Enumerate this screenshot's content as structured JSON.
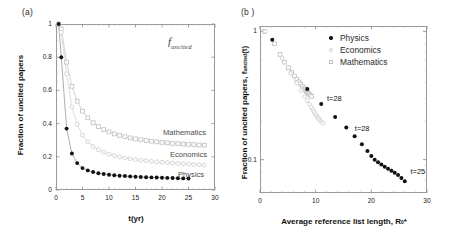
{
  "figure": {
    "panel_a_label": "(a)",
    "panel_b_label": "(b )"
  },
  "panel_a": {
    "annotation_f": "f",
    "annotation_sub": "uncited",
    "xlabel": "t(yr)",
    "ylabel": "Fraction of uncited papers",
    "xticks": [
      "0",
      "5",
      "10",
      "15",
      "20",
      "25",
      "30"
    ],
    "yticks": [
      "0",
      "0.2",
      "0.4",
      "0.6",
      "0.8",
      "1"
    ],
    "curve_labels": [
      "Mathematics",
      "Economics",
      "Physics"
    ]
  },
  "panel_b": {
    "xlabel_main": "Average reference list length, R",
    "xlabel_sub": "0",
    "xlabel_star": "*",
    "ylabel_main": "Fraction of uncited papers, f",
    "ylabel_sub": "uncited",
    "ylabel_tail": "(t)",
    "xticks": [
      "0",
      "10",
      "20",
      "30"
    ],
    "yticks": [
      "1",
      "0.1"
    ],
    "legend": [
      {
        "label": "Physics",
        "marker": "filled-circle",
        "color": "#111111"
      },
      {
        "label": "Economics",
        "marker": "open-circle",
        "color": "#cfcfcf"
      },
      {
        "label": "Mathematics",
        "marker": "open-square",
        "color": "#c2c2c2"
      }
    ],
    "annotations": [
      "t=28",
      "t=28",
      "t=25"
    ]
  },
  "chart_data": [
    {
      "type": "line",
      "panel": "a",
      "title": "",
      "xlabel": "t(yr)",
      "ylabel": "Fraction of uncited papers",
      "xlim": [
        0,
        30
      ],
      "ylim": [
        0,
        1
      ],
      "xticks": [
        0,
        5,
        10,
        15,
        20,
        25,
        30
      ],
      "yticks": [
        0,
        0.2,
        0.4,
        0.6,
        0.8,
        1
      ],
      "grid": false,
      "legend": "inline-right-labels",
      "series": [
        {
          "name": "Physics",
          "marker": "filled-circle",
          "color": "#111111",
          "x": [
            0.5,
            1,
            2,
            3,
            4,
            5,
            6,
            7,
            8,
            9,
            10,
            11,
            12,
            13,
            14,
            15,
            16,
            17,
            18,
            19,
            20,
            21,
            22,
            23,
            24,
            25
          ],
          "y": [
            1.0,
            0.8,
            0.37,
            0.22,
            0.162,
            0.132,
            0.118,
            0.108,
            0.101,
            0.096,
            0.092,
            0.089,
            0.086,
            0.084,
            0.082,
            0.08,
            0.078,
            0.077,
            0.076,
            0.075,
            0.074,
            0.073,
            0.072,
            0.071,
            0.07,
            0.069
          ]
        },
        {
          "name": "Economics",
          "marker": "open-circle",
          "color": "#cfcfcf",
          "x": [
            0.5,
            1,
            2,
            3,
            4,
            5,
            6,
            7,
            8,
            9,
            10,
            11,
            12,
            13,
            14,
            15,
            16,
            17,
            18,
            19,
            20,
            21,
            22,
            23,
            24,
            25,
            26,
            27,
            28
          ],
          "y": [
            1.0,
            0.95,
            0.7,
            0.5,
            0.395,
            0.33,
            0.29,
            0.262,
            0.242,
            0.228,
            0.216,
            0.207,
            0.199,
            0.193,
            0.188,
            0.183,
            0.179,
            0.176,
            0.173,
            0.17,
            0.167,
            0.165,
            0.162,
            0.16,
            0.158,
            0.156,
            0.154,
            0.152,
            0.15
          ]
        },
        {
          "name": "Mathematics",
          "marker": "open-square",
          "color": "#c2c2c2",
          "x": [
            0.5,
            1,
            2,
            3,
            4,
            5,
            6,
            7,
            8,
            9,
            10,
            11,
            12,
            13,
            14,
            15,
            16,
            17,
            18,
            19,
            20,
            21,
            22,
            23,
            24,
            25,
            26,
            27,
            28
          ],
          "y": [
            1.0,
            0.97,
            0.77,
            0.625,
            0.535,
            0.475,
            0.435,
            0.405,
            0.382,
            0.364,
            0.35,
            0.338,
            0.329,
            0.321,
            0.314,
            0.308,
            0.303,
            0.298,
            0.294,
            0.29,
            0.287,
            0.284,
            0.281,
            0.279,
            0.277,
            0.275,
            0.273,
            0.271,
            0.27
          ]
        }
      ]
    },
    {
      "type": "scatter",
      "panel": "b",
      "title": "",
      "xlabel": "Average reference list length, R0*",
      "ylabel": "Fraction of uncited papers, f_uncited(t)",
      "xlim": [
        0,
        30
      ],
      "ylim": [
        0.055,
        1.1
      ],
      "yscale": "log",
      "xticks": [
        0,
        10,
        20,
        30
      ],
      "yticks": [
        1,
        0.1
      ],
      "grid": false,
      "legend": "top-right",
      "annotations": [
        {
          "text": "t=28",
          "x": 11.5,
          "y": 0.3
        },
        {
          "text": "t=28",
          "x": 16.5,
          "y": 0.175
        },
        {
          "text": "t=25",
          "x": 26.5,
          "y": 0.082
        }
      ],
      "series": [
        {
          "name": "Physics",
          "marker": "filled-circle",
          "color": "#111111",
          "x": [
            2.2,
            8.5,
            11.0,
            13.5,
            15.5,
            17.0,
            18.3,
            19.3,
            20.0,
            20.6,
            21.2,
            21.8,
            22.4,
            23.0,
            23.6,
            24.2,
            24.8,
            25.4,
            26.0
          ],
          "y": [
            0.86,
            0.355,
            0.272,
            0.215,
            0.178,
            0.152,
            0.132,
            0.117,
            0.107,
            0.1,
            0.0955,
            0.0915,
            0.088,
            0.085,
            0.082,
            0.079,
            0.076,
            0.072,
            0.068
          ]
        },
        {
          "name": "Economics",
          "marker": "open-circle",
          "color": "#cfcfcf",
          "x": [
            1.0,
            4.0,
            5.5,
            6.6,
            7.4,
            8.0,
            8.5,
            8.9,
            9.2,
            9.5,
            9.7,
            9.9,
            10.1,
            10.3,
            10.5,
            10.7,
            10.9,
            11.1,
            11.3
          ],
          "y": [
            1.0,
            0.62,
            0.47,
            0.395,
            0.345,
            0.31,
            0.288,
            0.27,
            0.256,
            0.245,
            0.236,
            0.228,
            0.221,
            0.215,
            0.21,
            0.205,
            0.2,
            0.196,
            0.192
          ]
        },
        {
          "name": "Mathematics",
          "marker": "open-square",
          "color": "#c2c2c2",
          "x": [
            0.8,
            2.6,
            3.6,
            4.4,
            5.1,
            5.7,
            6.2,
            6.6,
            7.0,
            7.3,
            7.6,
            7.9,
            8.1,
            8.3,
            8.5,
            8.7,
            8.9,
            9.1,
            9.3
          ],
          "y": [
            1.0,
            0.8,
            0.66,
            0.575,
            0.52,
            0.478,
            0.448,
            0.424,
            0.404,
            0.388,
            0.374,
            0.362,
            0.352,
            0.343,
            0.335,
            0.328,
            0.322,
            0.316,
            0.311
          ]
        }
      ]
    }
  ]
}
